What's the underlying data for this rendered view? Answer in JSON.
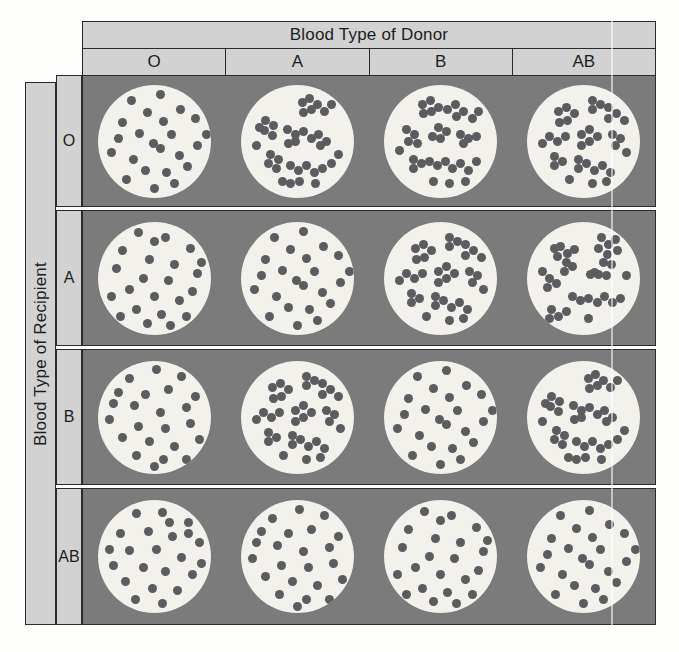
{
  "figure": {
    "column_axis_title": "Blood Type of Donor",
    "row_axis_title": "Blood Type of Recipient",
    "column_headers": [
      "O",
      "A",
      "B",
      "AB"
    ],
    "row_headers": [
      "O",
      "A",
      "B",
      "AB"
    ],
    "colors": {
      "header_background": "#d2d2d2",
      "cell_background": "#7b7b7b",
      "dish_fill": "#f2f1ec",
      "cell_dot": "#5c5c60",
      "border": "#2b2b2b",
      "page_background": "#fdfdfc"
    }
  },
  "chart_data": {
    "type": "table",
    "xlabel": "Blood Type of Donor",
    "ylabel": "Blood Type of Recipient",
    "categories": [
      "O",
      "A",
      "B",
      "AB"
    ],
    "row_categories": [
      "O",
      "A",
      "B",
      "AB"
    ],
    "legend": [
      "dispersed = no agglutination (compatible)",
      "clumped = agglutination (incompatible)"
    ],
    "cell_states": [
      [
        "dispersed",
        "clumped",
        "clumped",
        "clumped"
      ],
      [
        "dispersed",
        "dispersed",
        "clumped",
        "clumped"
      ],
      [
        "dispersed",
        "clumped",
        "dispersed",
        "clumped"
      ],
      [
        "dispersed",
        "dispersed",
        "dispersed",
        "dispersed"
      ]
    ],
    "series": [
      {
        "name": "Recipient O",
        "values": [
          0,
          1,
          1,
          1
        ]
      },
      {
        "name": "Recipient A",
        "values": [
          0,
          0,
          1,
          1
        ]
      },
      {
        "name": "Recipient B",
        "values": [
          0,
          1,
          0,
          1
        ]
      },
      {
        "name": "Recipient AB",
        "values": [
          0,
          0,
          0,
          0
        ]
      }
    ],
    "value_encoding": {
      "0": "dispersed",
      "1": "clumped"
    },
    "grid": true,
    "legend_position": "none"
  },
  "layout": {
    "row_tops": [
      75,
      210,
      349,
      488
    ],
    "row_heights": [
      132,
      136,
      136,
      137
    ],
    "dish_diameters": [
      113,
      113,
      113,
      113
    ]
  },
  "dish_patterns": {
    "dispersed_1": [
      [
        30,
        14
      ],
      [
        55,
        9
      ],
      [
        73,
        22
      ],
      [
        44,
        25
      ],
      [
        22,
        34
      ],
      [
        58,
        33
      ],
      [
        86,
        30
      ],
      [
        37,
        43
      ],
      [
        65,
        44
      ],
      [
        49,
        52
      ],
      [
        55,
        57
      ],
      [
        12,
        60
      ],
      [
        31,
        66
      ],
      [
        72,
        63
      ],
      [
        88,
        54
      ],
      [
        42,
        76
      ],
      [
        61,
        78
      ],
      [
        79,
        73
      ],
      [
        25,
        84
      ],
      [
        50,
        92
      ],
      [
        96,
        44
      ],
      [
        18,
        48
      ],
      [
        68,
        88
      ]
    ],
    "dispersed_2": [
      [
        34,
        12
      ],
      [
        57,
        11
      ],
      [
        80,
        20
      ],
      [
        20,
        30
      ],
      [
        45,
        28
      ],
      [
        66,
        32
      ],
      [
        90,
        38
      ],
      [
        28,
        45
      ],
      [
        52,
        44
      ],
      [
        74,
        51
      ],
      [
        14,
        58
      ],
      [
        40,
        60
      ],
      [
        60,
        63
      ],
      [
        84,
        66
      ],
      [
        24,
        72
      ],
      [
        48,
        78
      ],
      [
        70,
        80
      ],
      [
        92,
        56
      ],
      [
        33,
        88
      ],
      [
        57,
        92
      ],
      [
        80,
        30
      ],
      [
        10,
        44
      ],
      [
        63,
        20
      ]
    ],
    "dispersed_3": [
      [
        28,
        16
      ],
      [
        52,
        8
      ],
      [
        74,
        14
      ],
      [
        18,
        28
      ],
      [
        42,
        30
      ],
      [
        62,
        26
      ],
      [
        86,
        32
      ],
      [
        32,
        40
      ],
      [
        55,
        46
      ],
      [
        78,
        42
      ],
      [
        10,
        52
      ],
      [
        36,
        58
      ],
      [
        60,
        60
      ],
      [
        82,
        56
      ],
      [
        22,
        68
      ],
      [
        46,
        72
      ],
      [
        68,
        76
      ],
      [
        90,
        70
      ],
      [
        34,
        84
      ],
      [
        58,
        88
      ],
      [
        78,
        88
      ],
      [
        14,
        38
      ],
      [
        50,
        94
      ]
    ],
    "dispersed_4": [
      [
        36,
        10
      ],
      [
        60,
        14
      ],
      [
        82,
        24
      ],
      [
        22,
        26
      ],
      [
        46,
        34
      ],
      [
        68,
        38
      ],
      [
        88,
        46
      ],
      [
        16,
        42
      ],
      [
        40,
        50
      ],
      [
        62,
        52
      ],
      [
        84,
        62
      ],
      [
        28,
        60
      ],
      [
        50,
        66
      ],
      [
        72,
        70
      ],
      [
        12,
        66
      ],
      [
        34,
        78
      ],
      [
        56,
        82
      ],
      [
        78,
        84
      ],
      [
        92,
        36
      ],
      [
        44,
        90
      ],
      [
        64,
        92
      ],
      [
        20,
        84
      ],
      [
        50,
        18
      ]
    ],
    "clumped_1": [
      [
        30,
        22
      ],
      [
        36,
        28
      ],
      [
        27,
        31
      ],
      [
        35,
        36
      ],
      [
        42,
        25
      ],
      [
        24,
        24
      ],
      [
        33,
        44
      ],
      [
        40,
        40
      ],
      [
        66,
        14
      ],
      [
        72,
        20
      ],
      [
        63,
        24
      ],
      [
        71,
        29
      ],
      [
        78,
        16
      ],
      [
        80,
        26
      ],
      [
        68,
        36
      ],
      [
        75,
        38
      ],
      [
        60,
        45
      ],
      [
        20,
        50
      ],
      [
        26,
        55
      ],
      [
        18,
        58
      ],
      [
        56,
        47
      ],
      [
        63,
        47
      ],
      [
        70,
        48
      ],
      [
        40,
        66
      ],
      [
        47,
        70
      ],
      [
        54,
        68
      ],
      [
        62,
        72
      ],
      [
        69,
        66
      ],
      [
        76,
        72
      ],
      [
        83,
        68
      ],
      [
        22,
        78
      ],
      [
        28,
        84
      ],
      [
        20,
        86
      ],
      [
        35,
        80
      ],
      [
        88,
        48
      ],
      [
        14,
        44
      ],
      [
        54,
        86
      ]
    ],
    "clumped_2": [
      [
        22,
        32
      ],
      [
        29,
        36
      ],
      [
        21,
        41
      ],
      [
        28,
        45
      ],
      [
        16,
        38
      ],
      [
        54,
        16
      ],
      [
        61,
        12
      ],
      [
        68,
        18
      ],
      [
        62,
        22
      ],
      [
        55,
        25
      ],
      [
        74,
        24
      ],
      [
        80,
        18
      ],
      [
        41,
        40
      ],
      [
        48,
        44
      ],
      [
        55,
        42
      ],
      [
        48,
        50
      ],
      [
        42,
        52
      ],
      [
        62,
        48
      ],
      [
        69,
        44
      ],
      [
        76,
        50
      ],
      [
        70,
        54
      ],
      [
        26,
        62
      ],
      [
        33,
        66
      ],
      [
        24,
        70
      ],
      [
        31,
        74
      ],
      [
        44,
        72
      ],
      [
        51,
        76
      ],
      [
        58,
        72
      ],
      [
        65,
        78
      ],
      [
        72,
        74
      ],
      [
        80,
        70
      ],
      [
        86,
        62
      ],
      [
        14,
        54
      ],
      [
        37,
        86
      ],
      [
        44,
        88
      ],
      [
        52,
        86
      ],
      [
        66,
        88
      ]
    ],
    "clumped_3": [
      [
        34,
        18
      ],
      [
        41,
        14
      ],
      [
        48,
        20
      ],
      [
        42,
        24
      ],
      [
        35,
        26
      ],
      [
        56,
        22
      ],
      [
        63,
        18
      ],
      [
        70,
        24
      ],
      [
        64,
        28
      ],
      [
        78,
        30
      ],
      [
        84,
        24
      ],
      [
        20,
        40
      ],
      [
        27,
        44
      ],
      [
        22,
        50
      ],
      [
        30,
        52
      ],
      [
        48,
        38
      ],
      [
        55,
        42
      ],
      [
        50,
        48
      ],
      [
        43,
        46
      ],
      [
        68,
        44
      ],
      [
        75,
        48
      ],
      [
        70,
        52
      ],
      [
        82,
        46
      ],
      [
        26,
        66
      ],
      [
        33,
        70
      ],
      [
        26,
        74
      ],
      [
        40,
        68
      ],
      [
        47,
        72
      ],
      [
        54,
        68
      ],
      [
        61,
        74
      ],
      [
        68,
        70
      ],
      [
        75,
        76
      ],
      [
        82,
        68
      ],
      [
        14,
        58
      ],
      [
        44,
        86
      ],
      [
        58,
        88
      ],
      [
        72,
        86
      ]
    ],
    "clumped_4": [
      [
        28,
        24
      ],
      [
        35,
        20
      ],
      [
        42,
        26
      ],
      [
        36,
        32
      ],
      [
        29,
        34
      ],
      [
        58,
        14
      ],
      [
        65,
        18
      ],
      [
        58,
        22
      ],
      [
        72,
        20
      ],
      [
        79,
        26
      ],
      [
        72,
        30
      ],
      [
        86,
        32
      ],
      [
        20,
        46
      ],
      [
        27,
        50
      ],
      [
        34,
        46
      ],
      [
        48,
        44
      ],
      [
        55,
        40
      ],
      [
        62,
        46
      ],
      [
        55,
        50
      ],
      [
        48,
        54
      ],
      [
        76,
        44
      ],
      [
        83,
        48
      ],
      [
        78,
        54
      ],
      [
        24,
        64
      ],
      [
        31,
        68
      ],
      [
        24,
        72
      ],
      [
        46,
        66
      ],
      [
        53,
        70
      ],
      [
        46,
        74
      ],
      [
        60,
        76
      ],
      [
        67,
        72
      ],
      [
        74,
        78
      ],
      [
        88,
        60
      ],
      [
        14,
        52
      ],
      [
        38,
        84
      ],
      [
        58,
        88
      ],
      [
        70,
        86
      ]
    ]
  }
}
